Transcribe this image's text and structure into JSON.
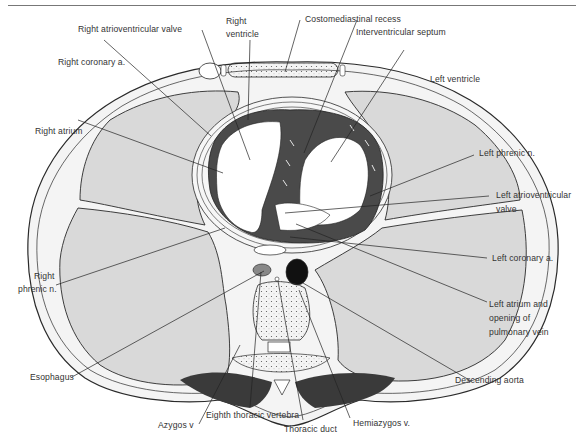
{
  "figure": {
    "colors": {
      "lung": "#d9d9d9",
      "muscle": "#4a4a4a",
      "outline": "#2a2a2a",
      "label": "#333333",
      "background": "#ffffff"
    }
  },
  "labels": {
    "right_av_valve": "Right atrioventricular valve",
    "right_ventricle_1": "Right",
    "right_ventricle_2": "ventricle",
    "costomediastinal_recess": "Costomediastinal recess",
    "interventricular_septum": "Interventricular septum",
    "right_coronary": "Right coronary a.",
    "left_ventricle": "Left ventricle",
    "right_atrium": "Right atrium",
    "left_phrenic": "Left phrenic n.",
    "left_av_valve_1": "Left atrioventricular",
    "left_av_valve_2": "valve",
    "right_phrenic_1": "Right",
    "right_phrenic_2": "phrenic n.",
    "left_coronary": "Left coronary a.",
    "left_atrium_1": "Left atrium and",
    "left_atrium_2": "opening of",
    "left_atrium_3": "pulmonary vein",
    "esophagus": "Esophagus",
    "descending_aorta": "Descending aorta",
    "azygos": "Azygos v",
    "eighth_vertebra": "Eighth thoracic vertebra",
    "hemiazygos": "Hemiazygos v.",
    "thoracic_duct": "Thoracic duct"
  }
}
